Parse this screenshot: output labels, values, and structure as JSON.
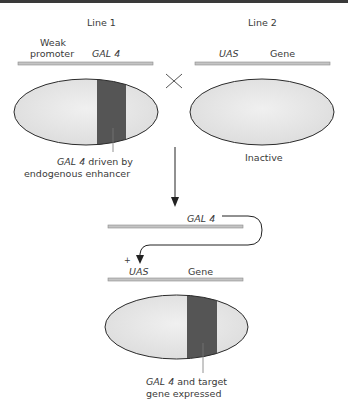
{
  "colors": {
    "cell_fill": "#e8e8e8",
    "cell_stroke": "#2b2b2b",
    "expression_band": "#555555",
    "dna_bar": "#bdbdbd",
    "top_bar": "#3a3a3a"
  },
  "line1": {
    "title": "Line 1",
    "promoter_label_line1": "Weak",
    "promoter_label_line2": "promoter",
    "gene_label": "GAL 4",
    "annotation_italic": "GAL 4",
    "annotation_rest": " driven by",
    "annotation_line2": "endogenous enhancer"
  },
  "line2": {
    "title": "Line 2",
    "uas_label": "UAS",
    "gene_label": "Gene",
    "status": "Inactive"
  },
  "cross_symbol": "×",
  "progeny": {
    "driver_label": "GAL 4",
    "plus_sign": "+",
    "uas_label": "UAS",
    "gene_label": "Gene",
    "annotation_italic": "GAL 4",
    "annotation_rest": " and target",
    "annotation_line2": "gene expressed"
  }
}
